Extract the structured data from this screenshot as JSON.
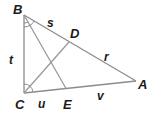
{
  "diagram": {
    "type": "triangle-with-angle-bisectors",
    "vertices": [
      {
        "id": "B",
        "label": "B",
        "x": 24,
        "y": 15
      },
      {
        "id": "C",
        "label": "C",
        "x": 24,
        "y": 93
      },
      {
        "id": "A",
        "label": "A",
        "x": 136,
        "y": 81
      },
      {
        "id": "D",
        "label": "D",
        "x": 69,
        "y": 43
      },
      {
        "id": "E",
        "label": "E",
        "x": 66,
        "y": 89
      }
    ],
    "segments": [
      {
        "from": "B",
        "to": "A"
      },
      {
        "from": "B",
        "to": "C"
      },
      {
        "from": "C",
        "to": "A"
      },
      {
        "from": "B",
        "to": "E"
      },
      {
        "from": "C",
        "to": "D"
      }
    ],
    "segment_labels": [
      {
        "id": "s",
        "label": "s",
        "segment": "BD"
      },
      {
        "id": "r",
        "label": "r",
        "segment": "DA"
      },
      {
        "id": "t",
        "label": "t",
        "segment": "BC"
      },
      {
        "id": "u",
        "label": "u",
        "segment": "CE"
      },
      {
        "id": "v",
        "label": "v",
        "segment": "EA"
      }
    ],
    "angle_marks": [
      {
        "vertex": "B",
        "note": "angle bisected by BE (two congruent arcs)"
      },
      {
        "vertex": "C",
        "note": "angle bisected by CD (two congruent arcs)"
      }
    ],
    "colors": {
      "line": "#8c8c8c",
      "text": "#1a1a1a",
      "background": "#ffffff"
    }
  }
}
